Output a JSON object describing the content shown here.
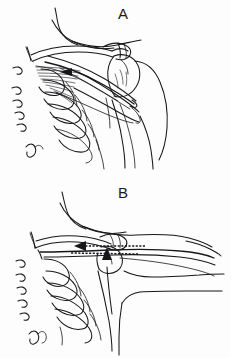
{
  "figure": {
    "background_color": "#fdfdfd",
    "ink_color": "#17171a",
    "width": 231,
    "height": 358
  },
  "panels": [
    {
      "id": "A",
      "label": "A",
      "caption": "Superior oblique view of shoulder girdle with serratus anterior fiber fan, scapula, rib cage and vertebral spinous processes; arm adducted at side.",
      "annotations": [
        {
          "name": "serratus-fiber-fan",
          "type": "fiber-fan",
          "description": "Radiating serratus anterior digitations converging toward the medial scapular border"
        },
        {
          "name": "convergence-arrowhead",
          "type": "arrowhead",
          "direction": "left",
          "description": "Small solid arrowhead at the fiber convergence point"
        }
      ]
    },
    {
      "id": "B",
      "label": "B",
      "caption": "Same shoulder girdle with the arm elevated to the horizontal; dashed vector indicates medial scapular translation and a vertical arrow marks the inferior scapular angle.",
      "annotations": [
        {
          "name": "medial-translation-vector",
          "type": "dashed-arrow",
          "direction": "left",
          "description": "Horizontal dashed line terminating in a leftward arrowhead showing direction of scapular pull"
        },
        {
          "name": "inferior-angle-pointer",
          "type": "arrow",
          "direction": "up",
          "description": "Slender vertical arrow pointing upward at the inferior angle of the scapula"
        }
      ]
    }
  ]
}
